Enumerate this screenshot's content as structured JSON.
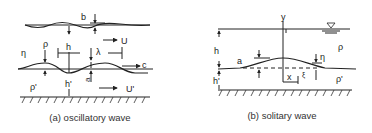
{
  "panels": [
    {
      "id": "a",
      "caption": "(a) oscillatory wave",
      "labels": {
        "b": "b",
        "U": "U",
        "rho": "ρ",
        "h": "h",
        "lambda": "λ",
        "eta": "η",
        "c": "c",
        "a": "a",
        "rho_prime": "ρ'",
        "h_prime": "h'",
        "U_prime": "U'"
      }
    },
    {
      "id": "b",
      "caption": "(b) solitary wave",
      "labels": {
        "y": "y",
        "h": "h",
        "rho": "ρ",
        "a": "a",
        "eta": "η",
        "x": "x",
        "xi": "ξ",
        "rho_prime": "ρ'",
        "h_prime": "h'"
      },
      "symbols": {
        "free_surface": "water-surface-triangle"
      }
    }
  ]
}
